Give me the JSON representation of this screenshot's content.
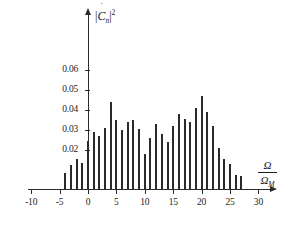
{
  "chart_data": {
    "type": "bar",
    "title": "",
    "subtitle": "",
    "xlabel": "Omega / Omega_M",
    "ylabel": "|C_n dot|^2",
    "xlim": [
      -13,
      34
    ],
    "ylim": [
      0,
      0.066
    ],
    "grid": false,
    "legend": null,
    "xticks": [
      -10,
      -5,
      0,
      5,
      10,
      15,
      20,
      25,
      30
    ],
    "xtick_labels": [
      "-10",
      "-5",
      "0",
      "5",
      "10",
      "15",
      "20",
      "25",
      "30"
    ],
    "yticks": [
      0.02,
      0.03,
      0.04,
      0.05,
      0.06
    ],
    "ytick_labels": [
      "0.02",
      "0.03",
      "0.04",
      "0.05",
      "0.06"
    ],
    "bar_color": "#2a2a2a",
    "x": [
      -4,
      -3,
      -2,
      -1,
      0,
      1,
      2,
      3,
      4,
      5,
      6,
      7,
      8,
      9,
      10,
      11,
      12,
      13,
      14,
      15,
      16,
      17,
      18,
      19,
      20,
      21,
      22,
      23,
      24,
      25,
      26,
      27
    ],
    "values": [
      0.0085,
      0.0125,
      0.0155,
      0.0135,
      0.0245,
      0.0289,
      0.0268,
      0.0309,
      0.044,
      0.035,
      0.0298,
      0.034,
      0.035,
      0.0305,
      0.018,
      0.0258,
      0.0328,
      0.0278,
      0.024,
      0.032,
      0.038,
      0.0355,
      0.034,
      0.041,
      0.047,
      0.039,
      0.032,
      0.021,
      0.0155,
      0.0128,
      0.0072,
      0.0068
    ],
    "ylabel_parts": {
      "open": "|",
      "symbol": "C",
      "dot": "˙",
      "sub": "n",
      "close": "|",
      "power": "2"
    },
    "xlabel_parts": {
      "numerator": "Ω",
      "denominator": "Ω",
      "denominator_sub": "M"
    }
  }
}
